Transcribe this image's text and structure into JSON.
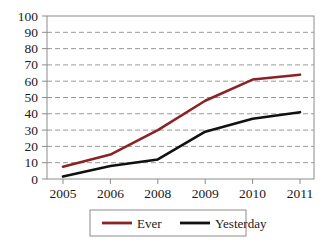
{
  "chart_data": {
    "type": "line",
    "title": "",
    "xlabel": "",
    "ylabel": "",
    "categories": [
      "2005",
      "2006",
      "2008",
      "2009",
      "2010",
      "2011"
    ],
    "x": [
      2005,
      2006,
      2008,
      2009,
      2010,
      2011
    ],
    "series": [
      {
        "name": "Ever",
        "color": "#8a2226",
        "values": [
          7.5,
          15,
          30,
          48,
          61,
          64
        ]
      },
      {
        "name": "Yesterday",
        "color": "#111111",
        "values": [
          1.5,
          8,
          12,
          29,
          37,
          41
        ]
      }
    ],
    "ylim": [
      0,
      100
    ],
    "yticks": [
      0,
      10,
      20,
      30,
      40,
      50,
      60,
      70,
      80,
      90,
      100
    ],
    "ytick_labels": [
      "0",
      "10",
      "20",
      "30",
      "40",
      "50",
      "60",
      "70",
      "80",
      "90",
      "100"
    ],
    "xtick_labels": [
      "2005",
      "2006",
      "2008",
      "2009",
      "2010",
      "2011"
    ],
    "grid": "horizontal-dashed",
    "grid_color": "#999999",
    "legend_position": "bottom-center",
    "legend_entries": [
      {
        "label": "Ever",
        "color": "#8a2226"
      },
      {
        "label": "Yesterday",
        "color": "#111111"
      }
    ],
    "axis_color": "#8c8c8c",
    "plot_border": true
  }
}
